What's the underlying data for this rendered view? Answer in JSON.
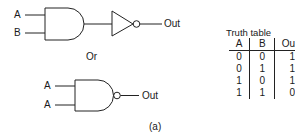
{
  "circuit1": {
    "inputs": [
      "A",
      "B"
    ],
    "gates": [
      "and-gate",
      "not-gate"
    ],
    "output_label": "Out"
  },
  "separator": "Or",
  "circuit2": {
    "inputs": [
      "A",
      "A"
    ],
    "gates": [
      "nand-gate"
    ],
    "output_label": "Out"
  },
  "truth_table": {
    "title": "Truth table",
    "headers": [
      "A",
      "B",
      "Ou"
    ],
    "rows": [
      [
        "0",
        "0",
        "1"
      ],
      [
        "0",
        "1",
        "1"
      ],
      [
        "1",
        "0",
        "1"
      ],
      [
        "1",
        "1",
        "0"
      ]
    ]
  },
  "caption": "(a)",
  "colors": {
    "line": "#222222",
    "background": "#ffffff"
  }
}
